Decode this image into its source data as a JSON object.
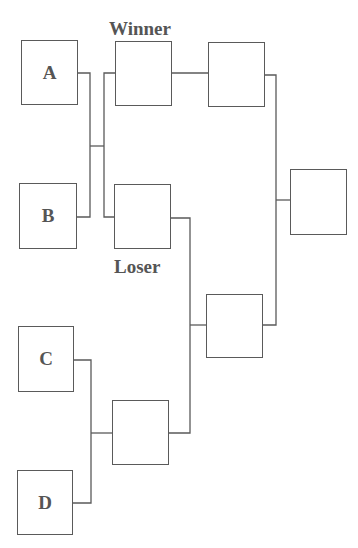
{
  "diagram": {
    "type": "double-elimination-bracket",
    "labels": {
      "winner": "Winner",
      "loser": "Loser"
    },
    "entrants": [
      {
        "id": "A",
        "label": "A"
      },
      {
        "id": "B",
        "label": "B"
      },
      {
        "id": "C",
        "label": "C"
      },
      {
        "id": "D",
        "label": "D"
      }
    ],
    "slots": [
      {
        "id": "winner-slot",
        "label": ""
      },
      {
        "id": "loser-slot",
        "label": ""
      },
      {
        "id": "winners-final-slot",
        "label": ""
      },
      {
        "id": "cd-winner-slot",
        "label": ""
      },
      {
        "id": "losers-final-slot",
        "label": ""
      },
      {
        "id": "champion-slot",
        "label": ""
      }
    ],
    "colors": {
      "stroke": "#5a5a5a",
      "text": "#555555",
      "background": "#ffffff"
    }
  }
}
